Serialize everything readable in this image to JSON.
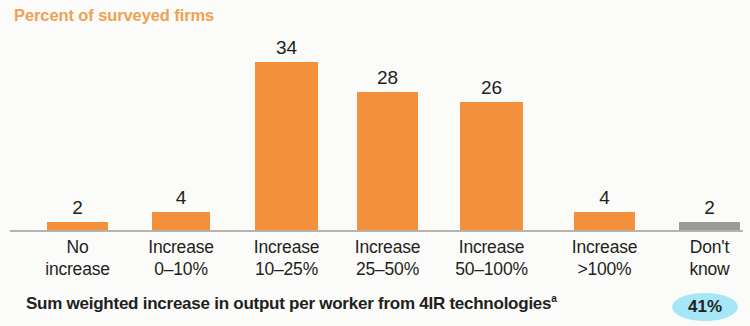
{
  "chart_data": {
    "type": "bar",
    "title": "Percent of surveyed firms",
    "xlabel": "",
    "ylabel": "Percent of surveyed firms",
    "ylim": [
      0,
      36
    ],
    "grid": false,
    "legend": "none",
    "categories": [
      "No increase",
      "Increase 0–10%",
      "Increase 10–25%",
      "Increase 25–50%",
      "Increase 50–100%",
      "Increase >100%",
      "Don't know"
    ],
    "category_lines": [
      [
        "No",
        "increase"
      ],
      [
        "Increase",
        "0–10%"
      ],
      [
        "Increase",
        "10–25%"
      ],
      [
        "Increase",
        "25–50%"
      ],
      [
        "Increase",
        "50–100%"
      ],
      [
        "Increase",
        ">100%"
      ],
      [
        "Don't",
        "know"
      ]
    ],
    "values": [
      2,
      4,
      34,
      28,
      26,
      4,
      2
    ],
    "bar_colors": [
      "#f2903c",
      "#f2903c",
      "#f2903c",
      "#f2903c",
      "#f2903c",
      "#f2903c",
      "#9c9a97"
    ],
    "value_labels": [
      "2",
      "4",
      "34",
      "28",
      "26",
      "4",
      "2"
    ],
    "annotations": [
      {
        "text": "Sum weighted increase in output per worker from 4IR technologies",
        "superscript": "a",
        "badge": "41%"
      }
    ]
  },
  "footnote": {
    "text": "Sum weighted increase in output per worker from 4IR technologies",
    "superscript": "a"
  },
  "badge": {
    "value": "41%"
  },
  "colors": {
    "bar_orange": "#f2903c",
    "bar_grey": "#9c9a97",
    "title_orange": "#f0a153",
    "badge_blue": "#a6e7f7",
    "axis_grey": "#b6b2ae",
    "background": "#fbfbfa"
  }
}
